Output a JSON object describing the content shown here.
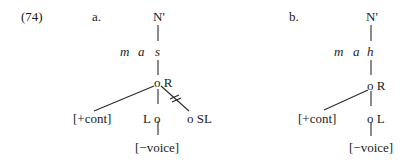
{
  "example_number": "(74)",
  "tree_a": {
    "label": "a.",
    "root": "N'",
    "segments": [
      "m",
      "a",
      "s"
    ],
    "root_node": "o R",
    "feature_left": "[+cont]",
    "laryngeal_label": "L",
    "laryngeal_node": "o",
    "soft_palate": "o SL",
    "feature_bottom": "[−voice]",
    "delink_mark": "="
  },
  "tree_b": {
    "label": "b.",
    "root": "N'",
    "segments": [
      "m",
      "a",
      "h"
    ],
    "root_node": "o R",
    "feature_left": "[+cont]",
    "laryngeal_node": "o L",
    "feature_bottom": "[−voice]"
  }
}
